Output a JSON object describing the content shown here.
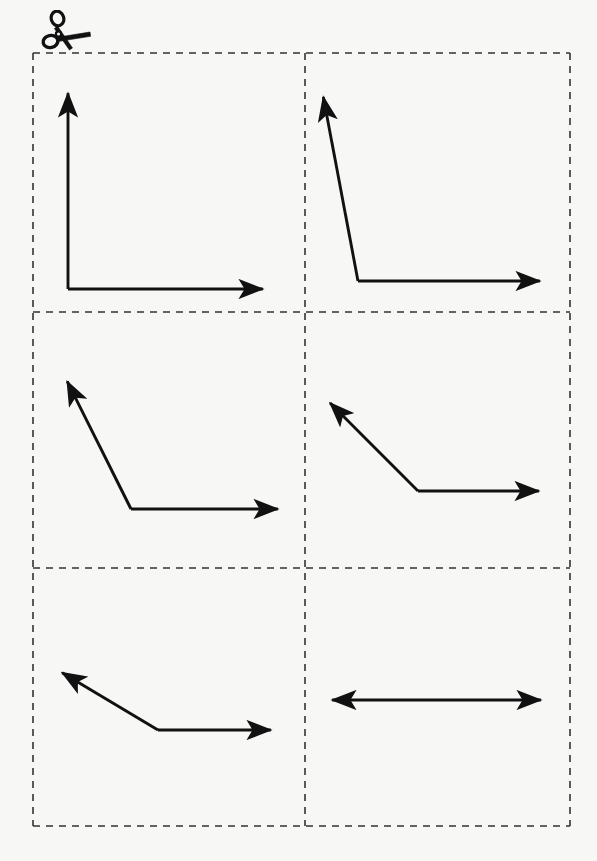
{
  "page": {
    "background_color": "#f7f7f5",
    "ink_color": "#111111",
    "width": 597,
    "height": 861
  },
  "decorations": {
    "cut_line_icon": {
      "name": "scissors-icon",
      "glyph": "✂",
      "x": 38,
      "y": 10
    }
  },
  "grid": {
    "name": "cut-out-grid",
    "columns": 2,
    "rows": 3,
    "left": 33,
    "top": 53,
    "right": 570,
    "bottom": 826,
    "col_divider_x": 305,
    "row_divider_y": [
      312,
      568
    ],
    "border_style": "dashed",
    "dash_pattern": "7 6",
    "stroke_width": 1.6,
    "stroke_color": "#333333"
  },
  "figures": [
    {
      "id": "angle-1",
      "name": "right-angle-figure",
      "label": "right angle",
      "degrees": 90,
      "cell": {
        "row": 1,
        "col": 1
      },
      "vertex": {
        "x": 68,
        "y": 289
      },
      "rays": [
        {
          "name": "ray-vertical-up",
          "tip": {
            "x": 68,
            "y": 86
          },
          "arrowhead": true
        },
        {
          "name": "ray-horizontal-right",
          "tip": {
            "x": 270,
            "y": 289
          },
          "arrowhead": true
        }
      ]
    },
    {
      "id": "angle-2",
      "name": "obtuse-angle-figure-100",
      "label": "obtuse angle",
      "degrees": 100,
      "cell": {
        "row": 1,
        "col": 2
      },
      "vertex": {
        "x": 358,
        "y": 281
      },
      "rays": [
        {
          "name": "ray-up-left-steep",
          "tip": {
            "x": 322,
            "y": 90
          },
          "arrowhead": true
        },
        {
          "name": "ray-horizontal-right",
          "tip": {
            "x": 547,
            "y": 281
          },
          "arrowhead": true
        }
      ]
    },
    {
      "id": "angle-3",
      "name": "obtuse-angle-figure-125",
      "label": "obtuse angle",
      "degrees": 125,
      "cell": {
        "row": 2,
        "col": 1
      },
      "vertex": {
        "x": 131,
        "y": 509
      },
      "rays": [
        {
          "name": "ray-up-left",
          "tip": {
            "x": 64,
            "y": 375
          },
          "arrowhead": true
        },
        {
          "name": "ray-horizontal-right",
          "tip": {
            "x": 285,
            "y": 509
          },
          "arrowhead": true
        }
      ]
    },
    {
      "id": "angle-4",
      "name": "obtuse-angle-figure-135",
      "label": "obtuse angle",
      "degrees": 135,
      "cell": {
        "row": 2,
        "col": 2
      },
      "vertex": {
        "x": 418,
        "y": 491
      },
      "rays": [
        {
          "name": "ray-up-left",
          "tip": {
            "x": 325,
            "y": 398
          },
          "arrowhead": true
        },
        {
          "name": "ray-horizontal-right",
          "tip": {
            "x": 546,
            "y": 491
          },
          "arrowhead": true
        }
      ]
    },
    {
      "id": "angle-5",
      "name": "obtuse-angle-figure-150",
      "label": "obtuse angle",
      "degrees": 150,
      "cell": {
        "row": 3,
        "col": 1
      },
      "vertex": {
        "x": 158,
        "y": 730
      },
      "rays": [
        {
          "name": "ray-up-left-shallow",
          "tip": {
            "x": 56,
            "y": 669
          },
          "arrowhead": true
        },
        {
          "name": "ray-horizontal-right",
          "tip": {
            "x": 278,
            "y": 730
          },
          "arrowhead": true
        }
      ]
    },
    {
      "id": "angle-6",
      "name": "straight-angle-figure",
      "label": "straight angle",
      "degrees": 180,
      "cell": {
        "row": 3,
        "col": 2
      },
      "vertex": {
        "x": 435,
        "y": 700
      },
      "rays": [
        {
          "name": "ray-horizontal-left",
          "tip": {
            "x": 325,
            "y": 700
          },
          "arrowhead": true
        },
        {
          "name": "ray-horizontal-right",
          "tip": {
            "x": 548,
            "y": 700
          },
          "arrowhead": true
        }
      ]
    }
  ]
}
